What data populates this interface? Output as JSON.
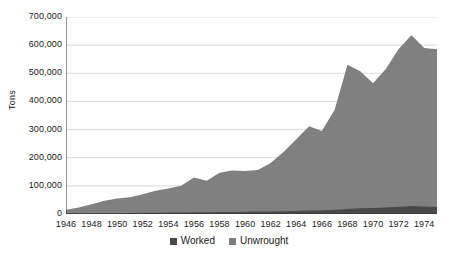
{
  "chart_data": {
    "type": "area",
    "stacked": true,
    "title": "",
    "subtitle": "",
    "xlabel": "",
    "ylabel": "Tons",
    "grid": true,
    "legend_position": "bottom",
    "xlim": [
      1946,
      1975
    ],
    "ylim": [
      0,
      700000
    ],
    "y_ticks": [
      0,
      100000,
      200000,
      300000,
      400000,
      500000,
      600000,
      700000
    ],
    "y_tick_labels": [
      "0",
      "100,000",
      "200,000",
      "300,000",
      "400,000",
      "500,000",
      "600,000",
      "700,000"
    ],
    "x_ticks": [
      1946,
      1947,
      1948,
      1949,
      1950,
      1951,
      1952,
      1953,
      1954,
      1955,
      1956,
      1957,
      1958,
      1959,
      1960,
      1961,
      1962,
      1963,
      1964,
      1965,
      1966,
      1967,
      1968,
      1969,
      1970,
      1971,
      1972,
      1973,
      1974,
      1975
    ],
    "x_tick_labels": [
      "1946",
      "1948",
      "1950",
      "1952",
      "1954",
      "1956",
      "1958",
      "1960",
      "1962",
      "1964",
      "1966",
      "1968",
      "1970",
      "1972",
      "1974"
    ],
    "x_tick_label_years": [
      1946,
      1948,
      1950,
      1952,
      1954,
      1956,
      1958,
      1960,
      1962,
      1964,
      1966,
      1968,
      1970,
      1972,
      1974
    ],
    "x": [
      1946,
      1947,
      1948,
      1949,
      1950,
      1951,
      1952,
      1953,
      1954,
      1955,
      1956,
      1957,
      1958,
      1959,
      1960,
      1961,
      1962,
      1963,
      1964,
      1965,
      1966,
      1967,
      1968,
      1969,
      1970,
      1971,
      1972,
      1973,
      1974,
      1975
    ],
    "series": [
      {
        "name": "Worked",
        "color": "#4a4a4a",
        "values": [
          1000,
          1500,
          2000,
          2500,
          3000,
          3500,
          4000,
          4500,
          5000,
          5500,
          6000,
          6500,
          7000,
          7500,
          8000,
          8500,
          9000,
          10000,
          11000,
          12000,
          13000,
          15000,
          18000,
          20000,
          21000,
          23000,
          26000,
          28000,
          27000,
          25000
        ]
      },
      {
        "name": "Unwrought",
        "color": "#808080",
        "values": [
          14000,
          22000,
          33000,
          45000,
          52000,
          56000,
          66000,
          78000,
          86000,
          95000,
          124000,
          112000,
          140000,
          147000,
          145000,
          148000,
          172000,
          210000,
          255000,
          300000,
          282000,
          355000,
          512000,
          487000,
          444000,
          492000,
          560000,
          607000,
          563000,
          560000
        ]
      }
    ],
    "totals": [
      15000,
      23500,
      35000,
      47500,
      55000,
      59500,
      70000,
      82500,
      91000,
      100500,
      130000,
      118500,
      147000,
      154500,
      153000,
      156500,
      181000,
      220000,
      266000,
      312000,
      295000,
      370000,
      530000,
      507000,
      465000,
      515000,
      586000,
      635000,
      590000,
      585000
    ]
  },
  "legend": {
    "items": [
      {
        "label": "Worked",
        "color": "#4a4a4a"
      },
      {
        "label": "Unwrought",
        "color": "#808080"
      }
    ]
  },
  "axis": {
    "y_title": "Tons"
  },
  "style": {
    "grid_color": "#d9d9d9",
    "axis_color": "#333333",
    "background": "#ffffff",
    "text_color": "#1a1a1a"
  }
}
